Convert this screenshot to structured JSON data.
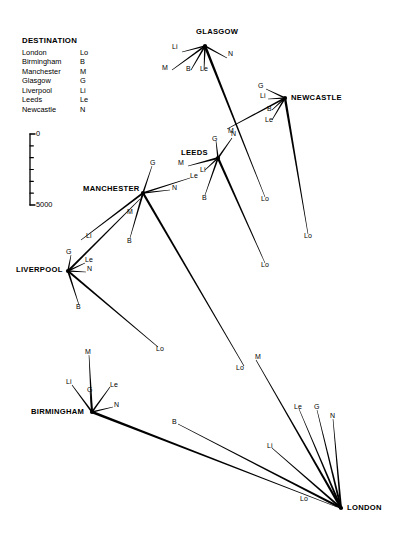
{
  "legend": {
    "title": "DESTINATION",
    "rows": [
      {
        "name": "London",
        "abbr": "Lo"
      },
      {
        "name": "Birmingham",
        "abbr": "B"
      },
      {
        "name": "Manchester",
        "abbr": "M"
      },
      {
        "name": "Glasgow",
        "abbr": "G"
      },
      {
        "name": "Liverpool",
        "abbr": "Li"
      },
      {
        "name": "Leeds",
        "abbr": "Le"
      },
      {
        "name": "Newcastle",
        "abbr": "N"
      }
    ]
  },
  "scale": {
    "top_label": "0",
    "bottom_label": "5000",
    "ticks": 5,
    "axis": {
      "x": 30,
      "y_top": 134,
      "y_bottom": 205
    }
  },
  "cities": [
    {
      "id": "glasgow",
      "label": "GLASGOW",
      "hub_x": 205,
      "hub_y": 46,
      "label_x": 196,
      "label_y": 27,
      "align": "center"
    },
    {
      "id": "newcastle",
      "label": "NEWCASTLE",
      "hub_x": 285,
      "hub_y": 98,
      "label_x": 291,
      "label_y": 93,
      "align": "left"
    },
    {
      "id": "leeds",
      "label": "LEEDS",
      "hub_x": 218,
      "hub_y": 158,
      "label_x": 181,
      "label_y": 148,
      "align": "left"
    },
    {
      "id": "manchester",
      "label": "MANCHESTER",
      "hub_x": 143,
      "hub_y": 193,
      "label_x": 83,
      "label_y": 184,
      "align": "left"
    },
    {
      "id": "liverpool",
      "label": "LIVERPOOL",
      "hub_x": 68,
      "hub_y": 271,
      "label_x": 16,
      "label_y": 265,
      "align": "left"
    },
    {
      "id": "birmingham",
      "label": "BIRMINGHAM",
      "hub_x": 92,
      "hub_y": 412,
      "label_x": 31,
      "label_y": 407,
      "align": "left"
    },
    {
      "id": "london",
      "label": "LONDON",
      "hub_x": 341,
      "hub_y": 508,
      "label_x": 347,
      "label_y": 503,
      "align": "left"
    }
  ],
  "flows": [
    {
      "from": "glasgow",
      "to": "liverpool",
      "abbr": "Li",
      "x1": 205,
      "y1": 46,
      "x2": 182,
      "y2": 52,
      "lx": 172,
      "ly": 47,
      "w": 1.6
    },
    {
      "from": "glasgow",
      "to": "newcastle",
      "abbr": "N",
      "x1": 205,
      "y1": 46,
      "x2": 227,
      "y2": 58,
      "lx": 228,
      "ly": 54,
      "w": 1.6
    },
    {
      "from": "glasgow",
      "to": "manchester",
      "abbr": "M",
      "x1": 205,
      "y1": 46,
      "x2": 172,
      "y2": 70,
      "lx": 162,
      "ly": 68,
      "w": 1.7
    },
    {
      "from": "glasgow",
      "to": "birmingham",
      "abbr": "B",
      "x1": 205,
      "y1": 46,
      "x2": 191,
      "y2": 70,
      "lx": 186,
      "ly": 69,
      "w": 1.7
    },
    {
      "from": "glasgow",
      "to": "leeds",
      "abbr": "Le",
      "x1": 205,
      "y1": 46,
      "x2": 204,
      "y2": 70,
      "lx": 200,
      "ly": 69,
      "w": 1.8
    },
    {
      "from": "glasgow",
      "to": "london",
      "abbr": "Lo",
      "x1": 205,
      "y1": 46,
      "x2": 265,
      "y2": 197,
      "lx": 261,
      "ly": 199,
      "w": 2.6
    },
    {
      "from": "newcastle",
      "to": "glasgow",
      "abbr": "G",
      "x1": 285,
      "y1": 98,
      "x2": 266,
      "y2": 89,
      "lx": 258,
      "ly": 86,
      "w": 1.6
    },
    {
      "from": "newcastle",
      "to": "liverpool",
      "abbr": "Li",
      "x1": 285,
      "y1": 98,
      "x2": 268,
      "y2": 99,
      "lx": 260,
      "ly": 96,
      "w": 1.6
    },
    {
      "from": "newcastle",
      "to": "birmingham",
      "abbr": "B",
      "x1": 285,
      "y1": 98,
      "x2": 272,
      "y2": 110,
      "lx": 267,
      "ly": 109,
      "w": 1.6
    },
    {
      "from": "newcastle",
      "to": "leeds",
      "abbr": "Le",
      "x1": 285,
      "y1": 98,
      "x2": 272,
      "y2": 120,
      "lx": 265,
      "ly": 120,
      "w": 1.7
    },
    {
      "from": "newcastle",
      "to": "london",
      "abbr": "Lo",
      "x1": 285,
      "y1": 98,
      "x2": 308,
      "y2": 234,
      "lx": 304,
      "ly": 236,
      "w": 2.4
    },
    {
      "from": "newcastle",
      "to": "manchester",
      "abbr": "M",
      "x1": 285,
      "y1": 98,
      "x2": 227,
      "y2": 129,
      "lx": 228,
      "ly": 131,
      "w": 1.9
    },
    {
      "from": "leeds",
      "to": "glasgow",
      "abbr": "G",
      "x1": 218,
      "y1": 158,
      "x2": 216,
      "y2": 141,
      "lx": 212,
      "ly": 139,
      "w": 1.6
    },
    {
      "from": "leeds",
      "to": "newcastle",
      "abbr": "N",
      "x1": 218,
      "y1": 158,
      "x2": 232,
      "y2": 138,
      "lx": 231,
      "ly": 134,
      "w": 1.7
    },
    {
      "from": "leeds",
      "to": "manchester",
      "abbr": "M",
      "x1": 218,
      "y1": 158,
      "x2": 188,
      "y2": 166,
      "lx": 178,
      "ly": 163,
      "w": 1.9
    },
    {
      "from": "leeds",
      "to": "liverpool",
      "abbr": "Li",
      "x1": 218,
      "y1": 158,
      "x2": 205,
      "y2": 170,
      "lx": 200,
      "ly": 170,
      "w": 1.6
    },
    {
      "from": "leeds",
      "to": "london",
      "abbr": "Lo",
      "x1": 218,
      "y1": 158,
      "x2": 265,
      "y2": 263,
      "lx": 261,
      "ly": 265,
      "w": 2.3
    },
    {
      "from": "leeds",
      "to": "birmingham",
      "abbr": "B",
      "x1": 218,
      "y1": 158,
      "x2": 205,
      "y2": 195,
      "lx": 202,
      "ly": 198,
      "w": 1.8
    },
    {
      "from": "manchester",
      "to": "glasgow",
      "abbr": "G",
      "x1": 143,
      "y1": 193,
      "x2": 152,
      "y2": 166,
      "lx": 150,
      "ly": 163,
      "w": 1.6
    },
    {
      "from": "manchester",
      "to": "newcastle",
      "abbr": "N",
      "x1": 143,
      "y1": 193,
      "x2": 170,
      "y2": 190,
      "lx": 172,
      "ly": 188,
      "w": 1.7
    },
    {
      "from": "manchester",
      "to": "leeds",
      "abbr": "Le",
      "x1": 143,
      "y1": 193,
      "x2": 190,
      "y2": 178,
      "lx": 190,
      "ly": 176,
      "w": 1.8
    },
    {
      "from": "manchester",
      "to": "liverpool",
      "abbr": "Li",
      "x1": 143,
      "y1": 193,
      "x2": 81,
      "y2": 240,
      "lx": 86,
      "ly": 236,
      "w": 2.0
    },
    {
      "from": "manchester",
      "to": "birmingham",
      "abbr": "B",
      "x1": 143,
      "y1": 193,
      "x2": 130,
      "y2": 238,
      "lx": 127,
      "ly": 241,
      "w": 2.0
    },
    {
      "from": "manchester",
      "to": "london",
      "abbr": "Lo",
      "x1": 143,
      "y1": 193,
      "x2": 244,
      "y2": 366,
      "lx": 236,
      "ly": 368,
      "w": 2.3
    },
    {
      "from": "liverpool",
      "to": "manchester",
      "abbr": "M",
      "x1": 68,
      "y1": 271,
      "x2": 140,
      "y2": 199,
      "lx": 127,
      "ly": 212,
      "w": 2.0
    },
    {
      "from": "liverpool",
      "to": "glasgow",
      "abbr": "G",
      "x1": 68,
      "y1": 271,
      "x2": 71,
      "y2": 255,
      "lx": 66,
      "ly": 252,
      "w": 1.6
    },
    {
      "from": "liverpool",
      "to": "leeds",
      "abbr": "Le",
      "x1": 68,
      "y1": 271,
      "x2": 85,
      "y2": 263,
      "lx": 85,
      "ly": 260,
      "w": 1.7
    },
    {
      "from": "liverpool",
      "to": "newcastle",
      "abbr": "N",
      "x1": 68,
      "y1": 271,
      "x2": 86,
      "y2": 272,
      "lx": 87,
      "ly": 269,
      "w": 1.6
    },
    {
      "from": "liverpool",
      "to": "birmingham",
      "abbr": "B",
      "x1": 68,
      "y1": 271,
      "x2": 79,
      "y2": 305,
      "lx": 76,
      "ly": 307,
      "w": 1.9
    },
    {
      "from": "liverpool",
      "to": "london",
      "abbr": "Lo",
      "x1": 68,
      "y1": 271,
      "x2": 158,
      "y2": 347,
      "lx": 156,
      "ly": 349,
      "w": 2.2
    },
    {
      "from": "birmingham",
      "to": "manchester",
      "abbr": "M",
      "x1": 92,
      "y1": 412,
      "x2": 89,
      "y2": 355,
      "lx": 85,
      "ly": 352,
      "w": 2.0
    },
    {
      "from": "birmingham",
      "to": "liverpool",
      "abbr": "Li",
      "x1": 92,
      "y1": 412,
      "x2": 72,
      "y2": 385,
      "lx": 66,
      "ly": 382,
      "w": 1.8
    },
    {
      "from": "birmingham",
      "to": "glasgow",
      "abbr": "G",
      "x1": 92,
      "y1": 412,
      "x2": 90,
      "y2": 392,
      "lx": 87,
      "ly": 390,
      "w": 1.6
    },
    {
      "from": "birmingham",
      "to": "leeds",
      "abbr": "Le",
      "x1": 92,
      "y1": 412,
      "x2": 110,
      "y2": 387,
      "lx": 110,
      "ly": 385,
      "w": 1.7
    },
    {
      "from": "birmingham",
      "to": "newcastle",
      "abbr": "N",
      "x1": 92,
      "y1": 412,
      "x2": 113,
      "y2": 407,
      "lx": 114,
      "ly": 405,
      "w": 1.7
    },
    {
      "from": "birmingham",
      "to": "london",
      "abbr": "Lo",
      "x1": 92,
      "y1": 412,
      "x2": 337,
      "y2": 507,
      "lx": 300,
      "ly": 499,
      "w": 2.5
    },
    {
      "from": "london",
      "to": "leeds",
      "abbr": "Le",
      "x1": 341,
      "y1": 508,
      "x2": 299,
      "y2": 409,
      "lx": 294,
      "ly": 407,
      "w": 2.1
    },
    {
      "from": "london",
      "to": "glasgow",
      "abbr": "G",
      "x1": 341,
      "y1": 508,
      "x2": 317,
      "y2": 410,
      "lx": 314,
      "ly": 407,
      "w": 2.1
    },
    {
      "from": "london",
      "to": "newcastle",
      "abbr": "N",
      "x1": 341,
      "y1": 508,
      "x2": 333,
      "y2": 419,
      "lx": 330,
      "ly": 416,
      "w": 2.0
    },
    {
      "from": "london",
      "to": "liverpool",
      "abbr": "Li",
      "x1": 341,
      "y1": 508,
      "x2": 272,
      "y2": 448,
      "lx": 267,
      "ly": 446,
      "w": 2.2
    },
    {
      "from": "london",
      "to": "birmingham",
      "abbr": "B",
      "x1": 341,
      "y1": 508,
      "x2": 178,
      "y2": 424,
      "lx": 172,
      "ly": 422,
      "w": 2.3
    },
    {
      "from": "london",
      "to": "manchester",
      "abbr": "M",
      "x1": 341,
      "y1": 508,
      "x2": 256,
      "y2": 360,
      "lx": 255,
      "ly": 357,
      "w": 2.5
    }
  ]
}
